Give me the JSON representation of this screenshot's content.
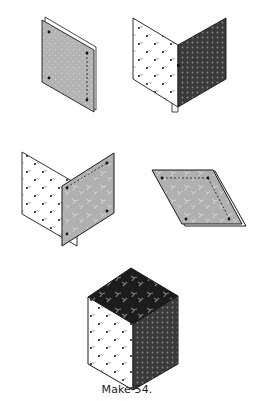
{
  "figure": {
    "caption": "Make 54.",
    "steps": [
      {
        "id": "step-1",
        "description": "gray patterned rhombus layered on another piece, dashed seam on right edge"
      },
      {
        "id": "step-2",
        "description": "light floral rhombus opened next to dark dotted rhombus"
      },
      {
        "id": "step-3",
        "description": "light floral rhombus opened with gray patterned rhombus, dashed seam on top"
      },
      {
        "id": "step-4",
        "description": "gray patterned rhombus lying flat, dashed seams on top and right"
      },
      {
        "id": "step-5",
        "description": "finished tumbling block cube: black floral top, light floral left, dark dotted right"
      }
    ]
  },
  "colors": {
    "outline": "#1a1a1a",
    "gray_fabric": "#b3b3b3",
    "gray_fabric_speckle": "#cfcfcf",
    "light_fabric": "#ffffff",
    "light_fabric_motif": "#333333",
    "dark_fabric": "#3a3a3a",
    "dark_fabric_dot": "#8a8a8a",
    "black_fabric": "#1c1c1c",
    "black_fabric_motif": "#7a7a7a"
  }
}
